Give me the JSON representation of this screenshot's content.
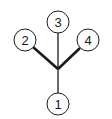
{
  "diagram": {
    "type": "tree",
    "colors": {
      "stroke": "#1a1a1a",
      "background": "#ffffff",
      "node_fill": "#ffffff"
    },
    "junction": {
      "x": 58,
      "y": 69
    },
    "nodes": [
      {
        "id": "node-1",
        "label": "1",
        "cx": 58,
        "cy": 104,
        "r": 11
      },
      {
        "id": "node-2",
        "label": "2",
        "cx": 25,
        "cy": 40,
        "r": 11
      },
      {
        "id": "node-3",
        "label": "3",
        "cx": 58,
        "cy": 22,
        "r": 11
      },
      {
        "id": "node-4",
        "label": "4",
        "cx": 88,
        "cy": 40,
        "r": 11
      }
    ],
    "edges": [
      {
        "from": "junction",
        "to": "node-1",
        "weight": "thin"
      },
      {
        "from": "junction",
        "to": "node-2",
        "weight": "thick"
      },
      {
        "from": "junction",
        "to": "node-3",
        "weight": "thin"
      },
      {
        "from": "junction",
        "to": "node-4",
        "weight": "thick"
      }
    ]
  }
}
